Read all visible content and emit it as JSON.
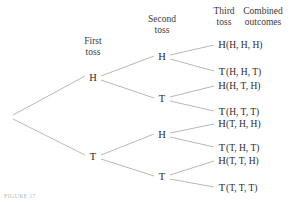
{
  "figure": {
    "caption_fragment": "FIGURE 17",
    "line_color": "#a6a6a6",
    "text_color": "#2b2b2b",
    "background": "#ffffff"
  },
  "headers": [
    {
      "name": "first-toss",
      "line1": "First",
      "line2": "toss",
      "x": 93,
      "y": 36
    },
    {
      "name": "second-toss",
      "line1": "Second",
      "line2": "toss",
      "x": 162,
      "y": 14
    },
    {
      "name": "third-toss",
      "line1": "Third",
      "line2": "toss",
      "x": 224,
      "y": 6
    },
    {
      "name": "combined-outcomes",
      "line1": "Combined",
      "line2": "outcomes",
      "x": 263,
      "y": 6
    }
  ],
  "nodes": {
    "root": {
      "x": 11,
      "y": 117
    },
    "level1": [
      {
        "name": "node-h",
        "label": "H",
        "x": 93,
        "y": 78
      },
      {
        "name": "node-t",
        "label": "T",
        "x": 93,
        "y": 157
      }
    ],
    "level2": [
      {
        "name": "node-h-h",
        "label": "H",
        "x": 162,
        "y": 57
      },
      {
        "name": "node-h-t",
        "label": "T",
        "x": 162,
        "y": 99
      },
      {
        "name": "node-t-h",
        "label": "H",
        "x": 162,
        "y": 135
      },
      {
        "name": "node-t-t",
        "label": "T",
        "x": 162,
        "y": 177
      }
    ],
    "level3": [
      {
        "name": "leaf-h-h-h",
        "label": "H",
        "x": 222,
        "y": 45
      },
      {
        "name": "leaf-h-h-t",
        "label": "T",
        "x": 222,
        "y": 72
      },
      {
        "name": "leaf-h-t-h",
        "label": "H",
        "x": 222,
        "y": 86
      },
      {
        "name": "leaf-h-t-t",
        "label": "T",
        "x": 222,
        "y": 112
      },
      {
        "name": "leaf-t-h-h",
        "label": "H",
        "x": 222,
        "y": 124
      },
      {
        "name": "leaf-t-h-t",
        "label": "T",
        "x": 222,
        "y": 148
      },
      {
        "name": "leaf-t-t-h",
        "label": "H",
        "x": 222,
        "y": 161
      },
      {
        "name": "leaf-t-t-t",
        "label": "T",
        "x": 222,
        "y": 188
      }
    ]
  },
  "outcomes": [
    {
      "name": "outcome-hhh",
      "text": "(H, H, H)",
      "x": 248,
      "y": 45
    },
    {
      "name": "outcome-hht",
      "text": "(H, H, T)",
      "x": 248,
      "y": 72
    },
    {
      "name": "outcome-hth",
      "text": "(H, T, H)",
      "x": 248,
      "y": 86
    },
    {
      "name": "outcome-htt",
      "text": "(H, T, T)",
      "x": 248,
      "y": 112
    },
    {
      "name": "outcome-thh",
      "text": "(T, H, H)",
      "x": 248,
      "y": 124
    },
    {
      "name": "outcome-tht",
      "text": "(T, H, T)",
      "x": 248,
      "y": 148
    },
    {
      "name": "outcome-tth",
      "text": "(T, T, H)",
      "x": 248,
      "y": 161
    },
    {
      "name": "outcome-ttt",
      "text": "(T, T, T)",
      "x": 248,
      "y": 188
    }
  ],
  "edges": [
    {
      "name": "edge-root-h",
      "x1": 13,
      "y1": 115,
      "x2": 85,
      "y2": 76
    },
    {
      "name": "edge-root-t",
      "x1": 13,
      "y1": 119,
      "x2": 85,
      "y2": 155
    },
    {
      "name": "edge-h-hh",
      "x1": 101,
      "y1": 76,
      "x2": 154,
      "y2": 56
    },
    {
      "name": "edge-h-ht",
      "x1": 101,
      "y1": 80,
      "x2": 154,
      "y2": 98
    },
    {
      "name": "edge-t-th",
      "x1": 101,
      "y1": 155,
      "x2": 154,
      "y2": 134
    },
    {
      "name": "edge-t-tt",
      "x1": 101,
      "y1": 159,
      "x2": 154,
      "y2": 176
    },
    {
      "name": "edge-hh-hhh",
      "x1": 170,
      "y1": 55,
      "x2": 214,
      "y2": 45
    },
    {
      "name": "edge-hh-hht",
      "x1": 170,
      "y1": 59,
      "x2": 214,
      "y2": 71
    },
    {
      "name": "edge-ht-hth",
      "x1": 170,
      "y1": 97,
      "x2": 214,
      "y2": 86
    },
    {
      "name": "edge-ht-htt",
      "x1": 170,
      "y1": 101,
      "x2": 214,
      "y2": 111
    },
    {
      "name": "edge-th-thh",
      "x1": 170,
      "y1": 133,
      "x2": 214,
      "y2": 124
    },
    {
      "name": "edge-th-tht",
      "x1": 170,
      "y1": 137,
      "x2": 214,
      "y2": 147
    },
    {
      "name": "edge-tt-tth",
      "x1": 170,
      "y1": 175,
      "x2": 214,
      "y2": 161
    },
    {
      "name": "edge-tt-ttt",
      "x1": 170,
      "y1": 179,
      "x2": 214,
      "y2": 187
    }
  ]
}
